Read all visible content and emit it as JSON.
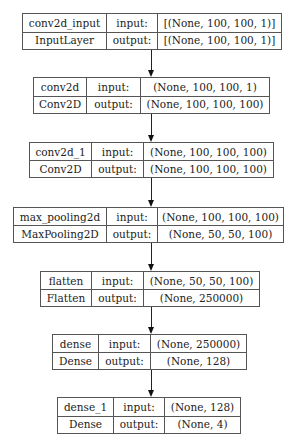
{
  "diagram": {
    "layers": [
      {
        "name": "conv2d_input",
        "type": "InputLayer",
        "input_label": "input:",
        "output_label": "output:",
        "input_shape": "[(None, 100, 100, 1)]",
        "output_shape": "[(None, 100, 100, 1)]"
      },
      {
        "name": "conv2d",
        "type": "Conv2D",
        "input_label": "input:",
        "output_label": "output:",
        "input_shape": "(None, 100, 100, 1)",
        "output_shape": "(None, 100, 100, 100)"
      },
      {
        "name": "conv2d_1",
        "type": "Conv2D",
        "input_label": "input:",
        "output_label": "output:",
        "input_shape": "(None, 100, 100, 100)",
        "output_shape": "(None, 100, 100, 100)"
      },
      {
        "name": "max_pooling2d",
        "type": "MaxPooling2D",
        "input_label": "input:",
        "output_label": "output:",
        "input_shape": "(None, 100, 100, 100)",
        "output_shape": "(None, 50, 50, 100)"
      },
      {
        "name": "flatten",
        "type": "Flatten",
        "input_label": "input:",
        "output_label": "output:",
        "input_shape": "(None, 50, 50, 100)",
        "output_shape": "(None, 250000)"
      },
      {
        "name": "dense",
        "type": "Dense",
        "input_label": "input:",
        "output_label": "output:",
        "input_shape": "(None, 250000)",
        "output_shape": "(None, 128)"
      },
      {
        "name": "dense_1",
        "type": "Dense",
        "input_label": "input:",
        "output_label": "output:",
        "input_shape": "(None, 128)",
        "output_shape": "(None, 4)"
      }
    ],
    "edges": [
      {
        "from": "conv2d_input",
        "to": "conv2d"
      },
      {
        "from": "conv2d",
        "to": "conv2d_1"
      },
      {
        "from": "conv2d_1",
        "to": "max_pooling2d"
      },
      {
        "from": "max_pooling2d",
        "to": "flatten"
      },
      {
        "from": "flatten",
        "to": "dense"
      },
      {
        "from": "dense",
        "to": "dense_1"
      }
    ],
    "colors": {
      "border": "#555555",
      "text": "#222222",
      "arrow": "#111111",
      "background": "#ffffff"
    }
  }
}
